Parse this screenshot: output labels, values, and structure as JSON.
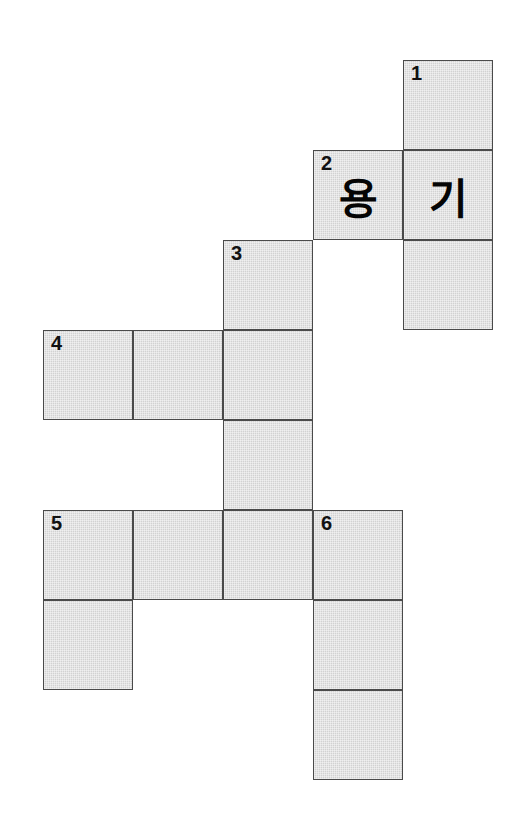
{
  "puzzle": {
    "kind": "korean-crossword-grid",
    "cell_size": 90,
    "origin": {
      "x": 43,
      "y": 60
    },
    "columns": 5,
    "rows": 8,
    "colors": {
      "cell_fill": "#d2d2d2",
      "cell_border": "#4a4a4a",
      "page_background": "#ffffff",
      "text": "#111111"
    },
    "clue_numbers": [
      "1",
      "2",
      "3",
      "4",
      "5",
      "6"
    ],
    "filled_letters": [
      "용",
      "기"
    ],
    "cells": [
      {
        "id": "c1",
        "col": 4,
        "row": 0,
        "number": "1",
        "letter": ""
      },
      {
        "id": "c2",
        "col": 3,
        "row": 1,
        "number": "2",
        "letter": "용"
      },
      {
        "id": "c3",
        "col": 4,
        "row": 1,
        "number": "",
        "letter": "기"
      },
      {
        "id": "c4",
        "col": 2,
        "row": 2,
        "number": "3",
        "letter": ""
      },
      {
        "id": "c5",
        "col": 4,
        "row": 2,
        "number": "",
        "letter": ""
      },
      {
        "id": "c6",
        "col": 0,
        "row": 3,
        "number": "4",
        "letter": ""
      },
      {
        "id": "c7",
        "col": 1,
        "row": 3,
        "number": "",
        "letter": ""
      },
      {
        "id": "c8",
        "col": 2,
        "row": 3,
        "number": "",
        "letter": ""
      },
      {
        "id": "c9",
        "col": 2,
        "row": 4,
        "number": "",
        "letter": ""
      },
      {
        "id": "c10",
        "col": 0,
        "row": 5,
        "number": "5",
        "letter": ""
      },
      {
        "id": "c11",
        "col": 1,
        "row": 5,
        "number": "",
        "letter": ""
      },
      {
        "id": "c12",
        "col": 2,
        "row": 5,
        "number": "",
        "letter": ""
      },
      {
        "id": "c13",
        "col": 3,
        "row": 5,
        "number": "6",
        "letter": ""
      },
      {
        "id": "c14",
        "col": 0,
        "row": 6,
        "number": "",
        "letter": ""
      },
      {
        "id": "c15",
        "col": 3,
        "row": 6,
        "number": "",
        "letter": ""
      },
      {
        "id": "c16",
        "col": 3,
        "row": 7,
        "number": "",
        "letter": ""
      }
    ]
  }
}
